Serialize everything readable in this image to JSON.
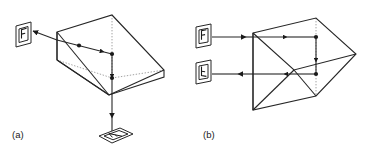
{
  "figure": {
    "background_color": "#ffffff",
    "line_color": "#262626",
    "hidden_line_color": "#8c8c8c",
    "width": 373,
    "height": 154
  },
  "panels": [
    {
      "id": "a",
      "label": "(a)",
      "description": "Pentaprism-type prism with object plate at left and image plate below",
      "plates": [
        {
          "id": "a-object",
          "letter": "F",
          "orientation": "upright",
          "position": "left"
        },
        {
          "id": "a-image",
          "letter": "F",
          "orientation": "rotated-perspective",
          "position": "bottom"
        }
      ],
      "ray_nodes": 4
    },
    {
      "id": "b",
      "label": "(b)",
      "description": "Prism with object plate at left and reflected image plate at lower left",
      "plates": [
        {
          "id": "b-object",
          "letter": "F",
          "orientation": "upright",
          "position": "upper-left"
        },
        {
          "id": "b-image",
          "letter": "F",
          "orientation": "flipped-vertical",
          "position": "lower-left"
        }
      ],
      "ray_nodes": 2
    }
  ],
  "labels": {
    "panel_a": "(a)",
    "panel_b": "(b)",
    "letter_f": "F"
  }
}
